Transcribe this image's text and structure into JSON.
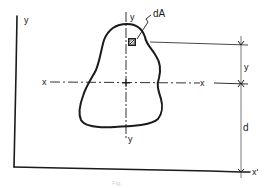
{
  "figure": {
    "type": "parallel-axis-theorem-diagram",
    "labels": {
      "outer_y_axis": "y",
      "centroid_y_axis_top": "y",
      "centroid_y_axis_bottom": "y",
      "centroid_x_axis_left": "x",
      "centroid_x_axis_right": "x",
      "element": "dA",
      "dim_y": "y",
      "dim_d": "d",
      "reference_axis": "x'"
    },
    "caption": "Fig."
  }
}
